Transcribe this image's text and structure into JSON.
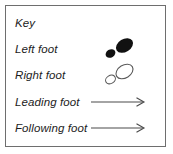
{
  "legend": {
    "title": "Key",
    "rows": [
      {
        "label": "Key",
        "symbol": "none"
      },
      {
        "label": "Left foot",
        "symbol": "filled-footprint-icon"
      },
      {
        "label": "Right foot",
        "symbol": "outlined-footprint-icon"
      },
      {
        "label": "Leading foot",
        "symbol": "arrow-right-icon"
      },
      {
        "label": "Following foot",
        "symbol": "arrow-right-icon"
      }
    ]
  },
  "colors": {
    "border": "#6e6e6e",
    "text": "#1c1c1c",
    "filled_foot": "#111111",
    "outlined_foot_stroke": "#5a5a5a",
    "outlined_foot_fill": "#ffffff",
    "arrow": "#4a4a4a",
    "background": "#ffffff"
  }
}
